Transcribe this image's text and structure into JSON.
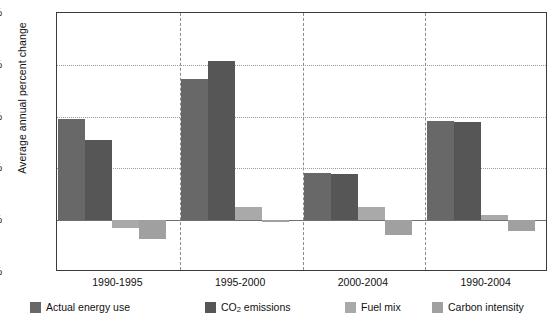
{
  "chart_data": {
    "type": "bar",
    "title": "",
    "xlabel": "",
    "ylabel": "Average annual percent change",
    "categories": [
      "1990-1995",
      "1995-2000",
      "2000-2004",
      "1990-2004"
    ],
    "ylim": [
      -0.5,
      2.0
    ],
    "yticks": [
      "-0.5%",
      "0.0%",
      "0.5%",
      "1.0%",
      "1.5%",
      "2.0%"
    ],
    "ytick_values": [
      -0.5,
      0.0,
      0.5,
      1.0,
      1.5,
      2.0
    ],
    "grid": "horizontal-dotted",
    "legend_position": "bottom",
    "series": [
      {
        "name": "Actual energy use",
        "color": "#686868",
        "values": [
          0.98,
          1.36,
          0.46,
          0.96
        ]
      },
      {
        "name": "CO2 emissions",
        "color": "#565656",
        "values": [
          0.77,
          1.54,
          0.45,
          0.95
        ]
      },
      {
        "name": "Fuel mix",
        "color": "#a9a9a9",
        "values": [
          -0.08,
          0.13,
          0.13,
          0.05
        ]
      },
      {
        "name": "Carbon intensity",
        "color": "#a0a0a0",
        "values": [
          -0.18,
          -0.02,
          -0.14,
          -0.1
        ]
      }
    ]
  },
  "legend": {
    "items": [
      {
        "label": "Actual energy use",
        "label_main": "Actual energy use",
        "sub": "",
        "label_tail": ""
      },
      {
        "label": "CO2 emissions",
        "label_main": "CO",
        "sub": "2",
        "label_tail": " emissions"
      },
      {
        "label": "Fuel mix",
        "label_main": "Fuel mix",
        "sub": "",
        "label_tail": ""
      },
      {
        "label": "Carbon intensity",
        "label_main": "Carbon intensity",
        "sub": "",
        "label_tail": ""
      }
    ]
  },
  "colors": {
    "axis": "#3b3b3b",
    "grid": "#9a9a9a",
    "zero": "#6f6f6f",
    "separator": "#8c8c8c",
    "text": "#111111",
    "background": "#ffffff"
  }
}
